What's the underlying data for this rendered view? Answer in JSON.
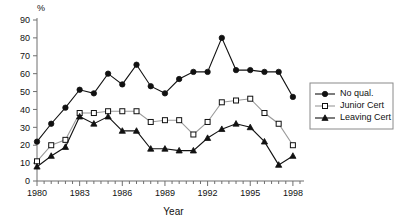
{
  "chart_data": {
    "type": "line",
    "title": "",
    "xlabel": "Year",
    "ylabel": "%",
    "unit_label": "%",
    "xlim": [
      1980,
      1998.5
    ],
    "ylim": [
      0,
      90
    ],
    "ytick_step": 10,
    "yticks": [
      0,
      10,
      20,
      30,
      40,
      50,
      60,
      70,
      80,
      90
    ],
    "ytick_labels": [
      "0",
      "10",
      "20",
      "30",
      "40",
      "50",
      "60",
      "70",
      "80",
      "90"
    ],
    "xticks_labeled": [
      1980,
      1983,
      1986,
      1989,
      1992,
      1995,
      1998
    ],
    "xtick_labels": [
      "1980",
      "1983",
      "1986",
      "1989",
      "1992",
      "1995",
      "1998"
    ],
    "minor_tick_interval": 0.5,
    "grid": false,
    "legend_position": "right",
    "x": [
      1980,
      1981,
      1982,
      1983,
      1984,
      1985,
      1986,
      1987,
      1988,
      1989,
      1990,
      1991,
      1992,
      1993,
      1994,
      1995,
      1996,
      1997,
      1998
    ],
    "series": [
      {
        "name": "No qual.",
        "marker": "filled-circle",
        "line_color": "#111111",
        "values": [
          22,
          32,
          41,
          51,
          49,
          60,
          54,
          65,
          53,
          49,
          57,
          61,
          61,
          80,
          62,
          62,
          61,
          61,
          47
        ]
      },
      {
        "name": "Junior Cert",
        "marker": "open-square",
        "line_color": "#9a9a9a",
        "values": [
          11,
          20,
          23,
          38,
          38,
          39,
          39,
          39,
          33,
          34,
          34,
          26,
          33,
          44,
          45,
          46,
          38,
          32,
          20
        ]
      },
      {
        "name": "Leaving Cert",
        "marker": "filled-triangle",
        "line_color": "#111111",
        "values": [
          8,
          14,
          19,
          36,
          32,
          36,
          28,
          28,
          18,
          18,
          17,
          17,
          24,
          29,
          32,
          30,
          22,
          9,
          14
        ]
      }
    ]
  },
  "legend": {
    "entries": [
      {
        "label": "No qual."
      },
      {
        "label": "Junior Cert"
      },
      {
        "label": "Leaving Cert"
      }
    ]
  },
  "axes": {
    "y_unit": "%",
    "x_title": "Year"
  }
}
